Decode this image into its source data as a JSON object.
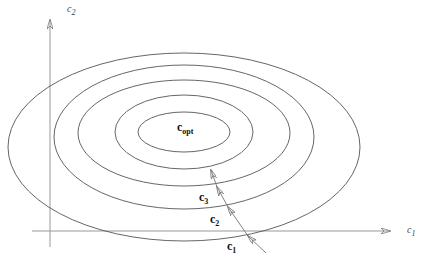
{
  "diagram": {
    "type": "contour-plot",
    "axes": {
      "x_label": {
        "base": "c",
        "sub": "1"
      },
      "y_label": {
        "base": "c",
        "sub": "2"
      }
    },
    "optimum_label": {
      "base": "c",
      "sub": "opt"
    },
    "iterate_labels": [
      {
        "base": "c",
        "sub": "1"
      },
      {
        "base": "c",
        "sub": "2"
      },
      {
        "base": "c",
        "sub": "3"
      }
    ],
    "contours": [
      {
        "cx": 184,
        "cy": 132,
        "rx": 46,
        "ry": 20
      },
      {
        "cx": 184,
        "cy": 132,
        "rx": 69,
        "ry": 37
      },
      {
        "cx": 184,
        "cy": 133,
        "rx": 106,
        "ry": 53
      },
      {
        "cx": 184,
        "cy": 137,
        "rx": 130,
        "ry": 72
      },
      {
        "cx": 184,
        "cy": 147,
        "rx": 176,
        "ry": 94
      }
    ],
    "path_points": [
      [
        266,
        253
      ],
      [
        248,
        236
      ],
      [
        228,
        207
      ],
      [
        217,
        187
      ],
      [
        211,
        170
      ]
    ],
    "colors": {
      "line": "#444444",
      "axis": "#888888",
      "text": "#111111"
    }
  }
}
